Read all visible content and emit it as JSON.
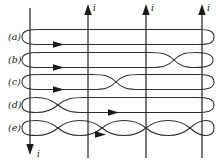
{
  "figure": {
    "background_color": "#ffffff",
    "line_color": "#2d2d2d",
    "text_color": "#1a1a1a",
    "width": 219,
    "height": 163
  },
  "row_labels": [
    {
      "id": "a",
      "text": "(a)",
      "x": 8,
      "y": 40
    },
    {
      "id": "b",
      "text": "(b)",
      "x": 8,
      "y": 63
    },
    {
      "id": "c",
      "text": "(c)",
      "x": 8,
      "y": 85
    },
    {
      "id": "d",
      "text": "(d)",
      "x": 8,
      "y": 108
    },
    {
      "id": "e",
      "text": "(e)",
      "x": 8,
      "y": 131
    }
  ],
  "current_labels": {
    "top": [
      {
        "text": "i",
        "x": 93,
        "y": 11
      },
      {
        "text": "i",
        "x": 151,
        "y": 11
      },
      {
        "text": "i",
        "x": 207,
        "y": 11
      }
    ],
    "bottom": [
      {
        "text": "i",
        "x": 37,
        "y": 157
      }
    ]
  },
  "wires": [
    {
      "name": "wire-left",
      "x": 30,
      "direction": "down",
      "arrow_at": "bottom"
    },
    {
      "name": "wire-second",
      "x": 88,
      "direction": "up",
      "arrow_at": "top"
    },
    {
      "name": "wire-third",
      "x": 146,
      "direction": "up",
      "arrow_at": "top"
    },
    {
      "name": "wire-right",
      "x": 202,
      "direction": "up",
      "arrow_at": "top"
    }
  ],
  "coils": [
    {
      "id": "a",
      "crossings": 0,
      "cross_positions": [],
      "center_y": 37,
      "arrow_x": 58,
      "arrow_y": 42
    },
    {
      "id": "b",
      "crossings": 1,
      "cross_positions": [
        174
      ],
      "center_y": 60,
      "arrow_x": 58,
      "arrow_y": 64
    },
    {
      "id": "c",
      "crossings": 1,
      "cross_positions": [
        116
      ],
      "center_y": 82,
      "arrow_x": 58,
      "arrow_y": 87
    },
    {
      "id": "d",
      "crossings": 1,
      "cross_positions": [
        58
      ],
      "center_y": 105,
      "arrow_x": 113,
      "arrow_y": 106
    },
    {
      "id": "e",
      "crossings": 3,
      "cross_positions": [
        58,
        116,
        174
      ],
      "center_y": 128,
      "arrow_x": 100,
      "arrow_y": 131
    }
  ]
}
